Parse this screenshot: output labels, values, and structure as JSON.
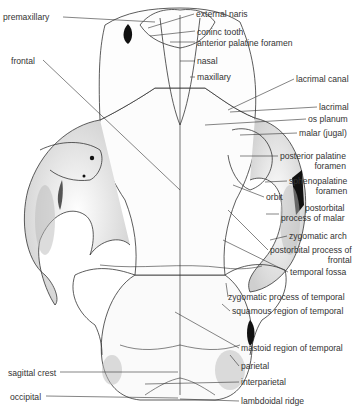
{
  "figure": {
    "labels_left": [
      {
        "id": "premaxillary",
        "text": "premaxillary",
        "x": 3,
        "y": 12
      },
      {
        "id": "frontal",
        "text": "frontal",
        "x": 11,
        "y": 56
      },
      {
        "id": "sagittal-crest",
        "text": "sagittal crest",
        "x": 8,
        "y": 368
      },
      {
        "id": "occipital",
        "text": "occipital",
        "x": 10,
        "y": 392
      }
    ],
    "labels_right": [
      {
        "id": "external-naris",
        "text": "external naris",
        "x": 196,
        "y": 10
      },
      {
        "id": "coninc-tooth",
        "text": "coninc tooth",
        "x": 197,
        "y": 27
      },
      {
        "id": "anterior-palatine-foramen",
        "text": "anterior palatine foramen",
        "x": 197,
        "y": 38
      },
      {
        "id": "nasal",
        "text": "nasal",
        "x": 197,
        "y": 57
      },
      {
        "id": "maxillary",
        "text": "maxillary",
        "x": 197,
        "y": 73
      },
      {
        "id": "lacrimal-canal",
        "text": "lacrimal canal",
        "x": 296,
        "y": 75
      },
      {
        "id": "lacrimal",
        "text": "lacrimal",
        "x": 319,
        "y": 103
      },
      {
        "id": "os-planum",
        "text": "os planum",
        "x": 308,
        "y": 115
      },
      {
        "id": "malar-jugal",
        "text": "malar (jugal)",
        "x": 299,
        "y": 129
      },
      {
        "id": "posterior-palatine-foramen",
        "text": "posterior palatine\nforamen",
        "x": 280,
        "y": 152
      },
      {
        "id": "sphenopalatine-foramen",
        "text": "sphenopalatine\nforamen",
        "x": 289,
        "y": 177
      },
      {
        "id": "orbit",
        "text": "orbit",
        "x": 266,
        "y": 193
      },
      {
        "id": "postorbital-process-of-malar",
        "text": "postorbital\nprocess of malar",
        "x": 281,
        "y": 204
      },
      {
        "id": "zygomatic-arch",
        "text": "zygomatic arch",
        "x": 289,
        "y": 232
      },
      {
        "id": "postorbital-process-of-frontal",
        "text": "postorbital process of\nfrontal",
        "x": 270,
        "y": 246
      },
      {
        "id": "temporal-fossa",
        "text": "temporal fossa",
        "x": 290,
        "y": 268
      },
      {
        "id": "zygomatic-process-of-temporal",
        "text": "zygomatic process of temporal",
        "x": 228,
        "y": 293
      },
      {
        "id": "squamous-region-of-temporal",
        "text": "squamous region of temporal",
        "x": 232,
        "y": 307
      },
      {
        "id": "mastoid-region-of-temporal",
        "text": "mastoid region of temporal",
        "x": 241,
        "y": 344
      },
      {
        "id": "parietal",
        "text": "parietal",
        "x": 241,
        "y": 362
      },
      {
        "id": "interparietal",
        "text": "interparietal",
        "x": 241,
        "y": 378
      },
      {
        "id": "lambdoidal-ridge",
        "text": "lambdoidal ridge",
        "x": 241,
        "y": 397
      }
    ],
    "colors": {
      "ink": "#333333",
      "shade": "#bdbdbd",
      "dark": "#111111",
      "paper": "#ffffff"
    }
  }
}
